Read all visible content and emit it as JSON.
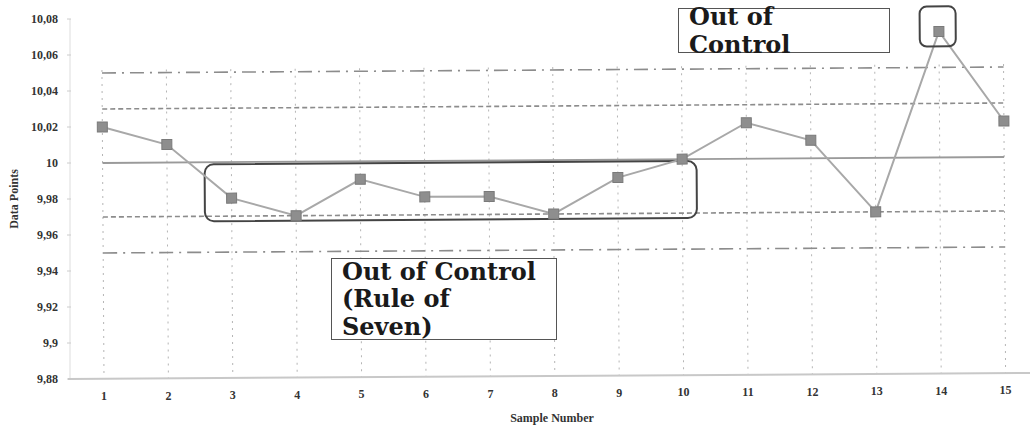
{
  "chart_data": {
    "type": "line",
    "title": "",
    "xlabel": "Sample Number",
    "ylabel": "Data Points",
    "x": [
      1,
      2,
      3,
      4,
      5,
      6,
      7,
      8,
      9,
      10,
      11,
      12,
      13,
      14,
      15
    ],
    "series": [
      {
        "name": "Data Points",
        "values": [
          10.02,
          10.01,
          9.98,
          9.97,
          9.99,
          9.98,
          9.98,
          9.97,
          9.99,
          10.0,
          10.02,
          10.01,
          9.97,
          10.07,
          10.02
        ],
        "marker": "square",
        "color": "#8a8a8a"
      }
    ],
    "control_lines": [
      {
        "name": "Upper Control Limit",
        "value": 10.05,
        "style": "dash-dot"
      },
      {
        "name": "Upper Warning Limit",
        "value": 10.03,
        "style": "dashed"
      },
      {
        "name": "Center Line",
        "value": 10.0,
        "style": "solid"
      },
      {
        "name": "Lower Warning Limit",
        "value": 9.97,
        "style": "dashed"
      },
      {
        "name": "Lower Control Limit",
        "value": 9.95,
        "style": "dash-dot"
      }
    ],
    "yticks": [
      "10,08",
      "10,06",
      "10,04",
      "10,02",
      "10",
      "9,98",
      "9,96",
      "9,94",
      "9,92",
      "9,9",
      "9,88"
    ],
    "ylim": [
      9.88,
      10.08
    ],
    "xticks": [
      "1",
      "2",
      "3",
      "4",
      "5",
      "6",
      "7",
      "8",
      "9",
      "10",
      "11",
      "12",
      "13",
      "14",
      "15"
    ],
    "grid": "vertical dotted",
    "legend": "none",
    "annotations": [
      {
        "text": "Out of Control",
        "target": "sample 14"
      },
      {
        "text": "Out of Control (Rule of Seven)",
        "target": "samples 3-10"
      }
    ]
  },
  "annotations": {
    "top_label": "Out of Control",
    "bottom_line1": "Out of Control",
    "bottom_line2": "(Rule of Seven)"
  },
  "axes": {
    "xlabel": "Sample Number",
    "ylabel": "Data Points"
  }
}
